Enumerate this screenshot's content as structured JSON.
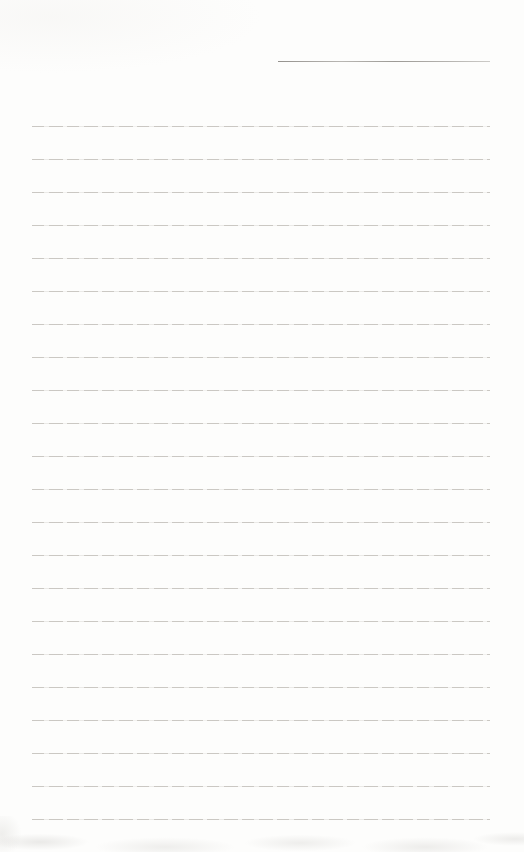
{
  "page": {
    "kind": "blank-lined-notepad-page",
    "background_color": "#fdfdfc",
    "text_content": "",
    "header_line": {
      "color": "#8c8984",
      "present": true
    },
    "ruled_lines": {
      "count": 22,
      "color": "#c8c5c0"
    }
  }
}
